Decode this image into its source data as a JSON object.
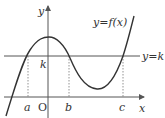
{
  "diagram": {
    "type": "function-graph",
    "curve_label": "y=f(x)",
    "line_label": "y=k",
    "axis_x_label": "x",
    "axis_y_label": "y",
    "origin_label": "O",
    "k_label": "k",
    "points": [
      "a",
      "b",
      "c"
    ],
    "colors": {
      "curve": "#333333",
      "axes": "#555555",
      "dotted": "#777777",
      "background": "#ffffff"
    }
  }
}
